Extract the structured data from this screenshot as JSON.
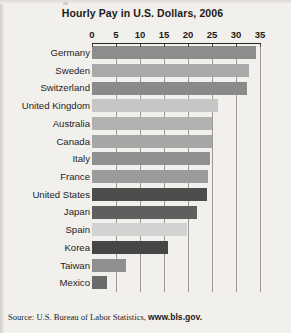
{
  "figure": {
    "title": "Hourly Pay in U.S. Dollars, 2006",
    "source_prefix": "Source: U.S. Bureau of Labor Statistics, ",
    "source_link": "www.bls.gov."
  },
  "chart_data": {
    "type": "bar",
    "orientation": "horizontal",
    "title": "Hourly Pay in U.S. Dollars, 2006",
    "xlabel": "",
    "ylabel": "",
    "xlim": [
      0,
      35
    ],
    "xticks": [
      0,
      5,
      10,
      15,
      20,
      25,
      30,
      35
    ],
    "xtick_labels": [
      "0",
      "5",
      "10",
      "15",
      "20",
      "25",
      "30",
      "35"
    ],
    "grid": "vertical",
    "legend": "none",
    "axis_position": "top",
    "categories": [
      "Germany",
      "Sweden",
      "Switzerland",
      "United Kingdom",
      "Australia",
      "Canada",
      "Italy",
      "France",
      "United States",
      "Japan",
      "Spain",
      "Korea",
      "Taiwan",
      "Mexico"
    ],
    "values": [
      34.2,
      32.8,
      32.2,
      26.3,
      24.9,
      24.9,
      24.6,
      24.2,
      24.0,
      21.8,
      19.8,
      15.8,
      7.1,
      3.1
    ],
    "bar_colors": [
      "#8d8d8d",
      "#a9a9a9",
      "#8a8a8a",
      "#c6c6c6",
      "#b2b2b2",
      "#a6a6a6",
      "#909090",
      "#9b9b9b",
      "#4d4d4d",
      "#5f5f5f",
      "#d2d2d2",
      "#464646",
      "#8f8f8f",
      "#6a6a6a"
    ],
    "bars": [
      {
        "category": "Germany",
        "value": 34.2,
        "color": "#8d8d8d"
      },
      {
        "category": "Sweden",
        "value": 32.8,
        "color": "#a9a9a9"
      },
      {
        "category": "Switzerland",
        "value": 32.2,
        "color": "#8a8a8a"
      },
      {
        "category": "United Kingdom",
        "value": 26.3,
        "color": "#c6c6c6"
      },
      {
        "category": "Australia",
        "value": 24.9,
        "color": "#b2b2b2"
      },
      {
        "category": "Canada",
        "value": 24.9,
        "color": "#a6a6a6"
      },
      {
        "category": "Italy",
        "value": 24.6,
        "color": "#909090"
      },
      {
        "category": "France",
        "value": 24.2,
        "color": "#9b9b9b"
      },
      {
        "category": "United States",
        "value": 24.0,
        "color": "#4d4d4d"
      },
      {
        "category": "Japan",
        "value": 21.8,
        "color": "#5f5f5f"
      },
      {
        "category": "Spain",
        "value": 19.8,
        "color": "#d2d2d2"
      },
      {
        "category": "Korea",
        "value": 15.8,
        "color": "#464646"
      },
      {
        "category": "Taiwan",
        "value": 7.1,
        "color": "#8f8f8f"
      },
      {
        "category": "Mexico",
        "value": 3.1,
        "color": "#6a6a6a"
      }
    ]
  }
}
